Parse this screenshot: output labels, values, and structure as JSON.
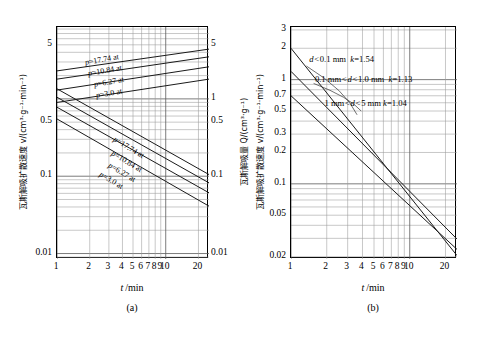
{
  "figure": {
    "panels": [
      {
        "id": "a",
        "caption": "(a)",
        "xlabel": "t /min",
        "ylabel_left": "瓦斯解吸扩散速度 v/(cm³·g⁻¹·min⁻¹)",
        "ylabel_right": "瓦斯解吸量 Q/(cm³·g⁻¹)",
        "xticks": [
          "1",
          "2",
          "3",
          "4",
          "5",
          "6",
          "7",
          "8",
          "9",
          "10",
          "20"
        ],
        "yticks_left": [
          "5",
          "0.5",
          "0.1",
          "0.01"
        ],
        "yticks_right": [
          "5",
          "1",
          "0.5",
          "0.1",
          "0.01"
        ],
        "curve_labels_upper": [
          "p=17.74 at",
          "p=10.84 at",
          "p=6.27 at",
          "p=3.0 at"
        ],
        "curve_labels_lower": [
          "p=17.74 at",
          "p=10.84 at",
          "p=6.27 at",
          "p=3.0 at"
        ]
      },
      {
        "id": "b",
        "caption": "(b)",
        "xlabel": "t /min",
        "ylabel_left": "瓦斯解吸扩散速度 v/(cm³·g⁻¹·min⁻¹)",
        "xticks": [
          "1",
          "2",
          "3",
          "4",
          "5",
          "6",
          "7",
          "8",
          "9",
          "10",
          "20"
        ],
        "yticks_left": [
          "3",
          "2",
          "1",
          "0.7",
          "0.5",
          "0.3",
          "0.2",
          "0.1",
          "0.05",
          "0.02"
        ],
        "annotations": [
          "d < 0.1 mm  k=1.54",
          "0.1 mm < d < 1.0 mm  k=1.13",
          "1 mm < d < 5 mm  k=1.04"
        ]
      }
    ]
  },
  "chart_data": [
    {
      "type": "line",
      "id": "a",
      "title": "",
      "xlabel": "t /min",
      "ylabel": "瓦斯解吸扩散速度 v/(cm³·g⁻¹·min⁻¹)",
      "ylabel_secondary": "瓦斯解吸量 Q/(cm³·g⁻¹)",
      "xscale": "log",
      "yscale": "log",
      "xlim": [
        1,
        25
      ],
      "ylim": [
        0.0085,
        8.5
      ],
      "grid": true,
      "xticks": [
        1,
        2,
        3,
        4,
        5,
        6,
        7,
        8,
        9,
        10,
        20
      ],
      "yticks_left": [
        5,
        0.5,
        0.1,
        0.01
      ],
      "yticks_right": [
        5,
        1,
        0.5,
        0.1,
        0.01
      ],
      "series": [
        {
          "name": "Q p=17.74 at",
          "kind": "quantity",
          "slope": 0.36,
          "points": [
            {
              "x": 1,
              "y": 2.3
            },
            {
              "x": 25,
              "y": 4.4
            }
          ]
        },
        {
          "name": "Q p=10.84 at",
          "kind": "quantity",
          "slope": 0.37,
          "points": [
            {
              "x": 1,
              "y": 1.8
            },
            {
              "x": 25,
              "y": 3.5
            }
          ]
        },
        {
          "name": "Q p=6.27 at",
          "kind": "quantity",
          "slope": 0.38,
          "points": [
            {
              "x": 1,
              "y": 1.3
            },
            {
              "x": 25,
              "y": 2.6
            }
          ]
        },
        {
          "name": "Q p=3.0 at",
          "kind": "quantity",
          "slope": 0.38,
          "points": [
            {
              "x": 1,
              "y": 0.9
            },
            {
              "x": 25,
              "y": 1.8
            }
          ]
        },
        {
          "name": "v p=17.74 at",
          "kind": "velocity",
          "slope": -0.62,
          "points": [
            {
              "x": 1,
              "y": 1.35
            },
            {
              "x": 25,
              "y": 0.105
            }
          ]
        },
        {
          "name": "v p=10.84 at",
          "kind": "velocity",
          "slope": -0.62,
          "points": [
            {
              "x": 1,
              "y": 1.05
            },
            {
              "x": 25,
              "y": 0.082
            }
          ]
        },
        {
          "name": "v p=6.27 at",
          "kind": "velocity",
          "slope": -0.62,
          "points": [
            {
              "x": 1,
              "y": 0.78
            },
            {
              "x": 25,
              "y": 0.061
            }
          ]
        },
        {
          "name": "v p=3.0 at",
          "kind": "velocity",
          "slope": -0.63,
          "points": [
            {
              "x": 1,
              "y": 0.55
            },
            {
              "x": 25,
              "y": 0.041
            }
          ]
        }
      ]
    },
    {
      "type": "line",
      "id": "b",
      "title": "",
      "xlabel": "t /min",
      "ylabel": "瓦斯解吸扩散速度 v/(cm³·g⁻¹·min⁻¹)",
      "xscale": "log",
      "yscale": "log",
      "xlim": [
        1,
        25
      ],
      "ylim": [
        0.019,
        3.2
      ],
      "grid": true,
      "xticks": [
        1,
        2,
        3,
        4,
        5,
        6,
        7,
        8,
        9,
        10,
        20
      ],
      "yticks": [
        3,
        2,
        1,
        0.7,
        0.5,
        0.3,
        0.2,
        0.1,
        0.05,
        0.02
      ],
      "series": [
        {
          "name": "d < 0.1 mm  k=1.54",
          "k": 1.54,
          "slope": -1.54,
          "points": [
            {
              "x": 1,
              "y": 2.0
            },
            {
              "x": 25,
              "y": 0.0205
            }
          ]
        },
        {
          "name": "0.1 mm < d < 1.0 mm  k=1.13",
          "k": 1.13,
          "slope": -1.13,
          "points": [
            {
              "x": 1,
              "y": 1.2
            },
            {
              "x": 25,
              "y": 0.0295
            }
          ]
        },
        {
          "name": "1 mm < d < 5 mm  k=1.04",
          "k": 1.04,
          "slope": -1.04,
          "points": [
            {
              "x": 1,
              "y": 0.7
            },
            {
              "x": 25,
              "y": 0.0235
            }
          ]
        }
      ]
    }
  ]
}
